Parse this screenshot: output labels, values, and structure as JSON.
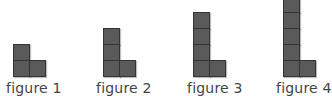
{
  "figures": [
    {
      "label": "figure 1",
      "column_height": 2,
      "base_width": 2
    },
    {
      "label": "figure 2",
      "column_height": 3,
      "base_width": 2
    },
    {
      "label": "figure 3",
      "column_height": 4,
      "base_width": 2
    },
    {
      "label": "figure 4",
      "column_height": 5,
      "base_width": 2
    }
  ],
  "colors": {
    "square_fill": "#5a5a5a",
    "square_border": "#333333",
    "label": "#444444"
  }
}
